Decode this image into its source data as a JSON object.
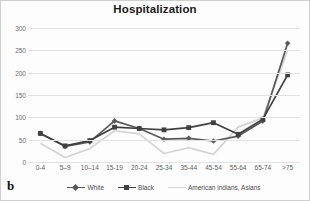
{
  "panel": {
    "letter": "b"
  },
  "chart_data": {
    "type": "line",
    "title": "Hospitalization",
    "xlabel": "",
    "ylabel": "",
    "categories": [
      "0-4",
      "5–9",
      "10–14",
      "15-19",
      "20-24",
      "25-34",
      "35-44",
      "45-54",
      "55-64",
      "65-74",
      ">75"
    ],
    "ylim": [
      0,
      300
    ],
    "yticks": [
      0,
      50,
      100,
      150,
      200,
      250,
      300
    ],
    "grid": true,
    "legend_position": "bottom",
    "series": [
      {
        "name": "White",
        "color": "#595959",
        "marker": "diamond",
        "values": [
          64,
          35,
          45,
          92,
          75,
          51,
          53,
          47,
          58,
          92,
          266
        ]
      },
      {
        "name": "Black",
        "color": "#404040",
        "marker": "square",
        "values": [
          64,
          36,
          48,
          78,
          75,
          72,
          77,
          88,
          62,
          96,
          195
        ]
      },
      {
        "name": "American indians, Asians",
        "color": "#d4d4d4",
        "marker": "none",
        "values": [
          42,
          10,
          30,
          70,
          63,
          19,
          32,
          17,
          78,
          99,
          250
        ]
      }
    ]
  }
}
